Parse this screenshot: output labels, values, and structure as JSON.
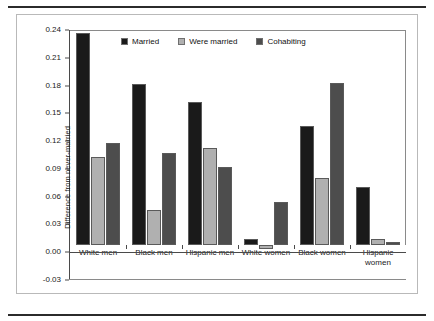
{
  "chart_data": {
    "type": "bar",
    "title": "",
    "xlabel": "",
    "ylabel": "Difference from never-married",
    "ylim": [
      -0.03,
      0.24
    ],
    "yticks": [
      "0.24",
      "0.21",
      "0.18",
      "0.15",
      "0.12",
      "0.09",
      "0.06",
      "0.03",
      "0.00",
      "-0.03"
    ],
    "ytick_values": [
      0.24,
      0.21,
      0.18,
      0.15,
      0.12,
      0.09,
      0.06,
      0.03,
      0.0,
      -0.03
    ],
    "grid": false,
    "legend_position": "top-center",
    "categories": [
      "White men",
      "Black men",
      "Hispanic men",
      "White women",
      "Black women",
      "Hispanic\nwomen"
    ],
    "series": [
      {
        "name": "Married",
        "color": "#1a1a1a",
        "values": [
          0.229,
          0.174,
          0.154,
          0.006,
          0.128,
          0.063
        ]
      },
      {
        "name": "Were married",
        "color": "#b0b0b0",
        "values": [
          0.095,
          0.038,
          0.105,
          -0.004,
          0.072,
          0.007
        ]
      },
      {
        "name": "Cohabiting",
        "color": "#4d4d4d",
        "values": [
          0.11,
          0.099,
          0.084,
          0.046,
          0.175,
          0.003
        ]
      }
    ]
  }
}
